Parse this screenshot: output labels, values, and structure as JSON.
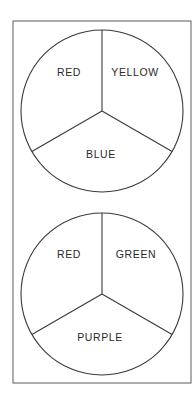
{
  "diagram": {
    "type": "color-wheel-pair",
    "frame": {
      "x": 13,
      "y": 21,
      "width": 178,
      "height": 362,
      "stroke": "#6a6a6a"
    },
    "wheels": [
      {
        "name": "top-wheel",
        "cx": 102,
        "cy": 111,
        "r": 81,
        "sectors": [
          {
            "label": "RED",
            "position": "upper-left",
            "lx": 69,
            "ly": 73
          },
          {
            "label": "YELLOW",
            "position": "upper-right",
            "lx": 135,
            "ly": 73
          },
          {
            "label": "BLUE",
            "position": "bottom",
            "lx": 101,
            "ly": 155
          }
        ]
      },
      {
        "name": "bottom-wheel",
        "cx": 102,
        "cy": 294,
        "r": 81,
        "sectors": [
          {
            "label": "RED",
            "position": "upper-left",
            "lx": 69,
            "ly": 255
          },
          {
            "label": "GREEN",
            "position": "upper-right",
            "lx": 136,
            "ly": 255
          },
          {
            "label": "PURPLE",
            "position": "bottom",
            "lx": 100,
            "ly": 338
          }
        ]
      }
    ]
  }
}
